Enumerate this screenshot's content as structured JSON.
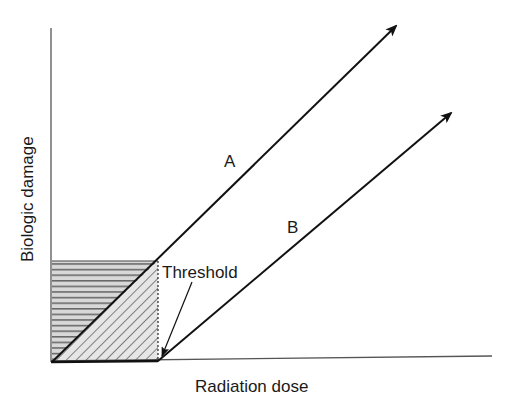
{
  "diagram": {
    "y_axis_label": "Biologic damage",
    "x_axis_label": "Radiation dose",
    "threshold_label": "Threshold",
    "curves": [
      {
        "label": "A",
        "description": "Linear no-threshold dose-response, starting at origin"
      },
      {
        "label": "B",
        "description": "Linear dose-response starting at threshold dose"
      }
    ],
    "colors": {
      "ink": "#1a1a1a",
      "axis": "#555555",
      "hatch": "#666666"
    }
  }
}
